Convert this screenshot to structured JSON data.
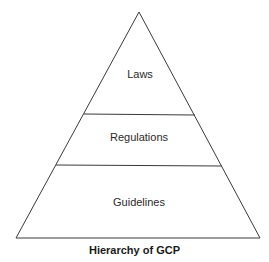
{
  "diagram": {
    "type": "pyramid",
    "levels": [
      {
        "label": "Laws"
      },
      {
        "label": "Regulations"
      },
      {
        "label": "Guidelines"
      }
    ],
    "caption": "Hierarchy of GCP",
    "line_color": "#3a3a3a"
  }
}
